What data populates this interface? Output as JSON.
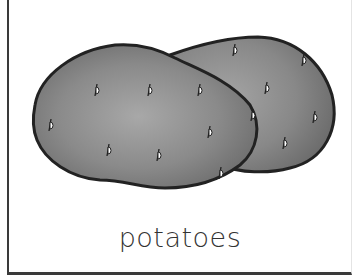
{
  "card": {
    "label": "potatoes",
    "border_color": "#3a3a3a"
  },
  "illustration": {
    "subject": "two potatoes",
    "outline_color": "#222222",
    "fill_highlight": "#a4a4a4",
    "fill_shadow": "#6e6e6e",
    "eye_count_left": 8,
    "eye_count_right": 6
  }
}
